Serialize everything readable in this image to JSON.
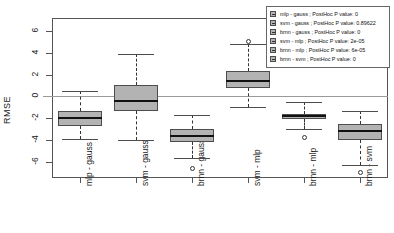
{
  "chart_data": {
    "type": "boxplot",
    "title": "",
    "xlabel": "",
    "ylabel": "RMSE",
    "ylim": [
      -7.5,
      7.2
    ],
    "yticks": [
      6,
      4,
      2,
      0,
      -2,
      -4,
      -6
    ],
    "ytick_labels": [
      "6",
      "4",
      "2",
      "0",
      "-2",
      "-4",
      "-6"
    ],
    "grid": false,
    "zero_reference_line": 0,
    "legend_position": "top-right",
    "categories": [
      "mlp - gauss",
      "svm - gauss",
      "brnn - gauss",
      "svm - mlp",
      "brnn - mlp",
      "brnn - svm"
    ],
    "boxes": [
      {
        "name": "mlp - gauss",
        "whisker_low": -3.9,
        "q1": -2.7,
        "median": -2.0,
        "q3": -1.3,
        "whisker_high": 0.5,
        "outliers": []
      },
      {
        "name": "svm - gauss",
        "whisker_low": -4.0,
        "q1": -1.3,
        "median": -0.4,
        "q3": 1.0,
        "whisker_high": 3.9,
        "outliers": []
      },
      {
        "name": "brnn - gauss",
        "whisker_low": -5.7,
        "q1": -4.2,
        "median": -3.6,
        "q3": -3.0,
        "whisker_high": -1.7,
        "outliers": [
          -6.6
        ]
      },
      {
        "name": "svm - mlp",
        "whisker_low": -1.0,
        "q1": 0.8,
        "median": 1.4,
        "q3": 2.3,
        "whisker_high": 4.8,
        "outliers": [
          5.0
        ]
      },
      {
        "name": "brnn - mlp",
        "whisker_low": -3.0,
        "q1": -2.1,
        "median": -1.8,
        "q3": -1.6,
        "whisker_high": -0.5,
        "outliers": [
          -3.8
        ]
      },
      {
        "name": "brnn - svm",
        "whisker_low": -6.3,
        "q1": -4.0,
        "median": -3.2,
        "q3": -2.5,
        "whisker_high": -1.3,
        "outliers": [
          -7.0
        ]
      }
    ],
    "legend_entries": [
      "mlp - gauss  ; PostHoc P value: 0",
      "svm - gauss  ; PostHoc P value: 0.89622",
      "brnn - gauss  ; PostHoc P value: 0",
      "svm - mlp  ; PostHoc P value: 2e-05",
      "brnn - mlp  ; PostHoc P value: 6e-05",
      "brnn - svm  ; PostHoc P value: 0"
    ],
    "colors": {
      "box_fill": "#b3b3b3",
      "box_border": "#4d4d4d",
      "median": "#111111",
      "whisker": "#333333",
      "axis": "#555555",
      "zero_line": "#9a9a9a",
      "background": "#ffffff"
    }
  }
}
